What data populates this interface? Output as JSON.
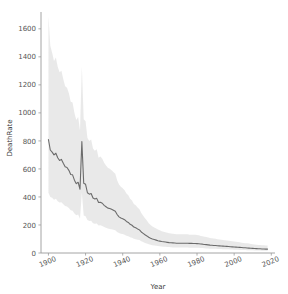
{
  "figure": {
    "background_color": "#ffffff",
    "title": "",
    "width": 288,
    "height": 294
  },
  "chart_data": {
    "type": "line",
    "title": "",
    "subtitle": "",
    "xlabel": "Year",
    "ylabel": "DeathRate",
    "xlim": [
      1896,
      2022
    ],
    "ylim": [
      -40,
      1720
    ],
    "grid": false,
    "legend": null,
    "line_color": "#6b6b6b",
    "band_color": "#e8e8e8",
    "band_label": "confidence interval",
    "xticks": [
      1900,
      1920,
      1940,
      1960,
      1980,
      2000,
      2020
    ],
    "xticklabels": [
      "1900",
      "1920",
      "1940",
      "1960",
      "1980",
      "2000",
      "2020"
    ],
    "yticks": [
      0,
      200,
      400,
      600,
      800,
      1000,
      1200,
      1400,
      1600
    ],
    "yticklabels": [
      "0",
      "200",
      "400",
      "600",
      "800",
      "1000",
      "1200",
      "1400",
      "1600"
    ],
    "x": [
      1900,
      1901,
      1902,
      1903,
      1904,
      1905,
      1906,
      1907,
      1908,
      1909,
      1910,
      1911,
      1912,
      1913,
      1914,
      1915,
      1916,
      1917,
      1918,
      1919,
      1920,
      1921,
      1922,
      1923,
      1924,
      1925,
      1926,
      1927,
      1928,
      1929,
      1930,
      1931,
      1932,
      1933,
      1934,
      1935,
      1936,
      1937,
      1938,
      1939,
      1940,
      1941,
      1942,
      1943,
      1944,
      1945,
      1946,
      1947,
      1948,
      1949,
      1950,
      1951,
      1952,
      1953,
      1954,
      1955,
      1956,
      1957,
      1958,
      1959,
      1960,
      1961,
      1962,
      1963,
      1964,
      1965,
      1966,
      1967,
      1968,
      1969,
      1970,
      1971,
      1972,
      1973,
      1974,
      1975,
      1976,
      1977,
      1978,
      1979,
      1980,
      1981,
      1982,
      1983,
      1984,
      1985,
      1986,
      1987,
      1988,
      1989,
      1990,
      1991,
      1992,
      1993,
      1994,
      1995,
      1996,
      1997,
      1998,
      1999,
      2000,
      2001,
      2002,
      2003,
      2004,
      2005,
      2006,
      2007,
      2008,
      2009,
      2010,
      2011,
      2012,
      2013,
      2014,
      2015,
      2016,
      2017,
      2018
    ],
    "series": [
      {
        "name": "DeathRate",
        "values": [
          810,
          735,
          720,
          700,
          712,
          680,
          660,
          668,
          640,
          615,
          610,
          590,
          560,
          558,
          520,
          495,
          505,
          455,
          795,
          498,
          490,
          430,
          420,
          425,
          392,
          385,
          390,
          360,
          362,
          355,
          340,
          330,
          320,
          318,
          312,
          305,
          298,
          275,
          258,
          250,
          245,
          238,
          225,
          218,
          205,
          198,
          185,
          180,
          172,
          165,
          150,
          140,
          130,
          122,
          112,
          105,
          100,
          96,
          92,
          88,
          85,
          82,
          80,
          78,
          76,
          74,
          73,
          72,
          71,
          70,
          70,
          70,
          70,
          70,
          70,
          70,
          69,
          69,
          68,
          68,
          67,
          66,
          64,
          63,
          61,
          60,
          58,
          56,
          55,
          54,
          53,
          52,
          51,
          50,
          49,
          48,
          47,
          46,
          45,
          44,
          43,
          42,
          41,
          40,
          39,
          38,
          37,
          36,
          35,
          34,
          33,
          32,
          31,
          30,
          30,
          29,
          29,
          28,
          28
        ]
      }
    ],
    "band_lower": [
      430,
      400,
      395,
      380,
      388,
      370,
      360,
      362,
      348,
      335,
      332,
      322,
      305,
      302,
      282,
      270,
      275,
      245,
      430,
      268,
      262,
      235,
      228,
      230,
      212,
      208,
      210,
      196,
      198,
      192,
      185,
      180,
      175,
      172,
      170,
      166,
      162,
      150,
      142,
      138,
      135,
      130,
      124,
      120,
      112,
      108,
      102,
      99,
      95,
      92,
      84,
      78,
      72,
      68,
      63,
      59,
      56,
      54,
      52,
      50,
      48,
      46,
      45,
      44,
      43,
      42,
      41,
      40,
      40,
      39,
      39,
      39,
      39,
      39,
      39,
      39,
      38,
      38,
      38,
      38,
      37,
      37,
      36,
      35,
      34,
      33,
      32,
      31,
      31,
      30,
      30,
      29,
      29,
      28,
      27,
      27,
      26,
      26,
      25,
      25,
      24,
      23,
      23,
      22,
      22,
      21,
      21,
      20,
      20,
      19,
      19,
      18,
      17,
      17,
      17,
      16,
      16,
      16,
      15
    ],
    "band_upper": [
      1690,
      1480,
      1430,
      1370,
      1395,
      1330,
      1290,
      1300,
      1240,
      1190,
      1180,
      1140,
      1080,
      1075,
      1000,
      950,
      970,
      875,
      1330,
      955,
      940,
      820,
      800,
      810,
      745,
      730,
      740,
      680,
      688,
      672,
      645,
      625,
      608,
      602,
      590,
      578,
      565,
      520,
      488,
      472,
      462,
      448,
      425,
      412,
      388,
      375,
      350,
      340,
      325,
      312,
      285,
      265,
      248,
      232,
      212,
      200,
      190,
      182,
      175,
      168,
      162,
      156,
      152,
      148,
      145,
      141,
      139,
      137,
      135,
      133,
      133,
      133,
      133,
      133,
      133,
      133,
      131,
      131,
      130,
      130,
      128,
      126,
      122,
      120,
      116,
      114,
      110,
      107,
      105,
      103,
      101,
      99,
      97,
      95,
      93,
      91,
      89,
      87,
      86,
      84,
      82,
      80,
      78,
      76,
      74,
      72,
      70,
      69,
      67,
      65,
      63,
      61,
      59,
      57,
      57,
      55,
      55,
      53,
      53
    ]
  }
}
